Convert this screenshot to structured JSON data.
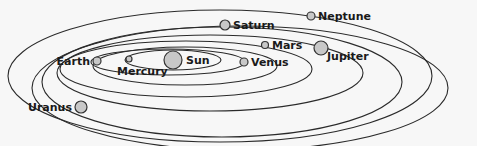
{
  "diagram": {
    "background": "#f7f7f7",
    "sun": {
      "name": "Sun",
      "cx": 173,
      "cy": 60,
      "r": 9
    },
    "planets": [
      {
        "name": "Mercury",
        "cx": 129,
        "cy": 59,
        "r": 3,
        "orbit": {
          "cx": 173,
          "cy": 60,
          "rx": 48,
          "ry": 10
        }
      },
      {
        "name": "Venus",
        "cx": 244,
        "cy": 62,
        "r": 4,
        "orbit": {
          "cx": 168,
          "cy": 62,
          "rx": 77,
          "ry": 13
        }
      },
      {
        "name": "Earth",
        "cx": 97,
        "cy": 61,
        "r": 4,
        "orbit": {
          "cx": 185,
          "cy": 66,
          "rx": 92,
          "ry": 19
        }
      },
      {
        "name": "Mars",
        "cx": 265,
        "cy": 45,
        "r": 3.5,
        "orbit": {
          "cx": 186,
          "cy": 69,
          "rx": 126,
          "ry": 28
        }
      },
      {
        "name": "Jupiter",
        "cx": 321,
        "cy": 48,
        "r": 7,
        "orbit": {
          "cx": 210,
          "cy": 73,
          "rx": 153,
          "ry": 38
        }
      },
      {
        "name": "Saturn",
        "cx": 225,
        "cy": 25,
        "r": 5,
        "orbit": {
          "cx": 222,
          "cy": 82,
          "rx": 180,
          "ry": 55
        }
      },
      {
        "name": "Uranus",
        "cx": 81,
        "cy": 107,
        "r": 6,
        "orbit": {
          "cx": 240,
          "cy": 88,
          "rx": 208,
          "ry": 62
        }
      },
      {
        "name": "Neptune",
        "cx": 311,
        "cy": 16,
        "r": 4,
        "orbit": {
          "cx": 220,
          "cy": 76,
          "rx": 212,
          "ry": 66
        }
      }
    ]
  }
}
